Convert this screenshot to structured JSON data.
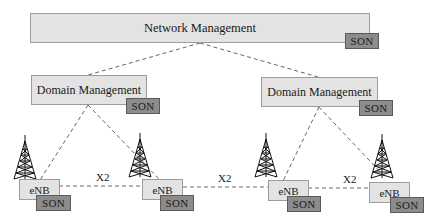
{
  "diagram": {
    "network_management": {
      "label": "Network Management",
      "son": "SON"
    },
    "domains": [
      {
        "label": "Domain Management",
        "son": "SON"
      },
      {
        "label": "Domain Management",
        "son": "SON"
      }
    ],
    "enbs": [
      {
        "label": "eNB",
        "son": "SON"
      },
      {
        "label": "eNB",
        "son": "SON"
      },
      {
        "label": "eNB",
        "son": "SON"
      },
      {
        "label": "eNB",
        "son": "SON"
      }
    ],
    "x2_links": [
      {
        "label": "X2"
      },
      {
        "label": "X2"
      },
      {
        "label": "X2"
      }
    ],
    "icons": {
      "tower": "cell-tower-icon"
    },
    "colors": {
      "box_fill": "#e3e3e3",
      "box_border": "#9c9c9c",
      "son_fill": "#8c8c8c",
      "link": "#555555"
    }
  }
}
